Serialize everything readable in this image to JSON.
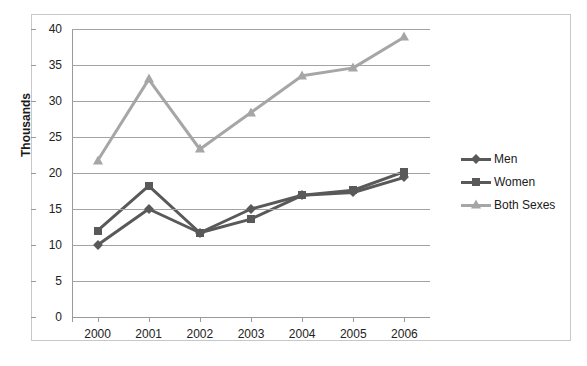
{
  "chart_data": {
    "type": "line",
    "title": "",
    "xlabel": "",
    "ylabel": "Thousands",
    "categories": [
      "2000",
      "2001",
      "2002",
      "2003",
      "2004",
      "2005",
      "2006"
    ],
    "ylim": [
      0,
      40
    ],
    "yticks": [
      0,
      5,
      10,
      15,
      20,
      25,
      30,
      35,
      40
    ],
    "grid": true,
    "legend_position": "right",
    "series": [
      {
        "name": "Men",
        "marker": "diamond",
        "color": "#595959",
        "values": [
          10.0,
          15.0,
          11.7,
          15.0,
          16.9,
          17.3,
          19.4
        ]
      },
      {
        "name": "Women",
        "marker": "square",
        "color": "#595959",
        "values": [
          12.0,
          18.2,
          11.7,
          13.6,
          16.9,
          17.6,
          20.2
        ]
      },
      {
        "name": "Both Sexes",
        "marker": "triangle",
        "color": "#a6a6a6",
        "values": [
          21.7,
          33.0,
          23.3,
          28.4,
          33.5,
          34.6,
          38.9
        ]
      }
    ]
  },
  "axis": {
    "y_title": "Thousands",
    "y_tick_labels": [
      "0",
      "5",
      "10",
      "15",
      "20",
      "25",
      "30",
      "35",
      "40"
    ],
    "x_tick_labels": [
      "2000",
      "2001",
      "2002",
      "2003",
      "2004",
      "2005",
      "2006"
    ]
  },
  "legend": {
    "items": [
      {
        "label": "Men"
      },
      {
        "label": "Women"
      },
      {
        "label": "Both Sexes"
      }
    ]
  },
  "colors": {
    "series_dark": "#595959",
    "series_light": "#a6a6a6",
    "gridline": "#a3a3a3",
    "frame": "#c8c8c8"
  }
}
